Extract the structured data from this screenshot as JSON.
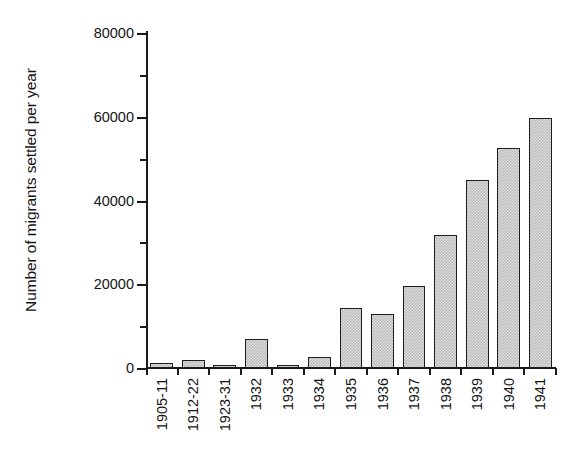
{
  "chart_data": {
    "type": "bar",
    "title": "",
    "subtitle": "",
    "xlabel": "",
    "ylabel": "Number of migrants settled per year",
    "categories": [
      "1905-11",
      "1912-22",
      "1923-31",
      "1932",
      "1933",
      "1934",
      "1935",
      "1936",
      "1937",
      "1938",
      "1939",
      "1940",
      "1941"
    ],
    "values": [
      1300,
      2000,
      700,
      7000,
      600,
      2700,
      14400,
      13000,
      19600,
      31700,
      44800,
      52500,
      59700
    ],
    "ylim": [
      0,
      80000
    ],
    "ytick_labels": [
      "0",
      "20000",
      "40000",
      "60000",
      "80000"
    ],
    "ytick_values": [
      0,
      20000,
      40000,
      60000,
      80000
    ],
    "yminor_tick_values": [
      10000,
      30000,
      50000,
      70000
    ],
    "grid": false,
    "legend": null,
    "legend_position": "none",
    "annotations": [],
    "bar_fill_color": "#bdbdbd",
    "bar_edge_color": "#1d1d1d",
    "axis_color": "#1a1a1a",
    "background_color": "#ffffff"
  }
}
